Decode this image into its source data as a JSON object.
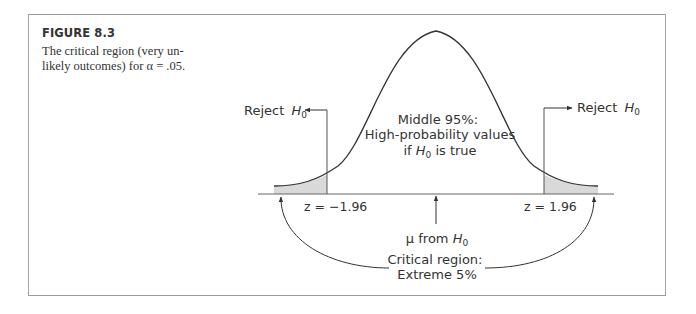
{
  "figure": {
    "title": "FIGURE 8.3",
    "caption_line1": "The critical region (very un-",
    "caption_line2": "likely outcomes) for α = .05."
  },
  "diagram": {
    "left_reject_label": "Reject",
    "right_reject_label": "Reject",
    "h0_symbol": "H",
    "h0_subscript": "0",
    "middle_line1": "Middle 95%:",
    "middle_line2": "High-probability values",
    "middle_line3_prefix": "if ",
    "middle_line3_suffix": " is true",
    "left_z_label": "z = −1.96",
    "right_z_label": "z = 1.96",
    "mean_label_prefix": "μ from ",
    "critical_line1": "Critical region:",
    "critical_line2": "Extreme 5%"
  },
  "colors": {
    "curve": "#333333",
    "shade": "#d9d9d9",
    "frame": "#a0a0a0",
    "text": "#333333"
  }
}
